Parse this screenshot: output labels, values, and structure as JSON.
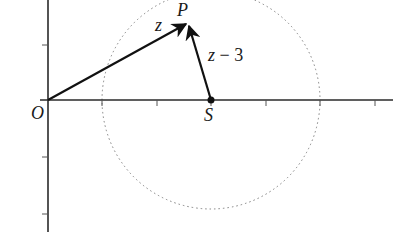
{
  "diagram": {
    "type": "argand-diagram",
    "colors": {
      "axis": "#2a2a2a",
      "vector": "#111111",
      "circle": "#777777",
      "background": "#ffffff"
    },
    "origin_label": "O",
    "points": {
      "P": {
        "label": "P"
      },
      "S": {
        "label": "S",
        "real": 3,
        "imag": 0
      }
    },
    "vectors": [
      {
        "from": "O",
        "to": "P",
        "label": "z"
      },
      {
        "from": "S",
        "to": "P",
        "label_var": "z",
        "label_op": "−",
        "label_num": "3"
      }
    ],
    "circle": {
      "center": "S",
      "radius": 2,
      "style": "dotted"
    },
    "axes": {
      "real_ticks": [
        1,
        2,
        3,
        4,
        5,
        6
      ],
      "imag_ticks": [
        1,
        -1,
        -2
      ]
    }
  }
}
